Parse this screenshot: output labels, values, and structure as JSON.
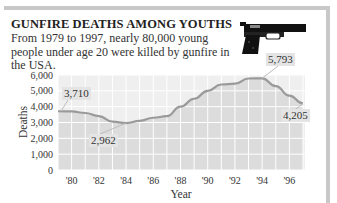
{
  "header": {
    "title": "GUNFIRE DEATHS AMONG YOUTHS",
    "subtitle": "From 1979 to 1997, nearly 80,000 young people under age 20 were killed by gunfire in the USA.",
    "icon": "handgun-icon"
  },
  "chart_data": {
    "type": "area",
    "title": "GUNFIRE DEATHS AMONG YOUTHS",
    "subtitle": "From 1979 to 1997, nearly 80,000 young people under age 20 were killed by gunfire in the USA.",
    "xlabel": "Year",
    "ylabel": "Deaths",
    "x": [
      1979,
      1980,
      1981,
      1982,
      1983,
      1984,
      1985,
      1986,
      1987,
      1988,
      1989,
      1990,
      1991,
      1992,
      1993,
      1994,
      1995,
      1996,
      1997
    ],
    "values": [
      3710,
      3700,
      3600,
      3400,
      3050,
      2962,
      3100,
      3300,
      3400,
      4000,
      4500,
      5000,
      5400,
      5450,
      5780,
      5793,
      5300,
      4700,
      4205
    ],
    "ylim": [
      0,
      6000
    ],
    "yticks": [
      0,
      1000,
      2000,
      3000,
      4000,
      5000,
      6000
    ],
    "ytick_labels": [
      "0",
      "1,000",
      "2,000",
      "3,000",
      "4,000",
      "5,000",
      "6,000"
    ],
    "xtick_labels": [
      "'80",
      "'82",
      "'84",
      "'86",
      "'88",
      "'90",
      "'92",
      "'94",
      "'96"
    ],
    "xtick_years": [
      1980,
      1982,
      1984,
      1986,
      1988,
      1990,
      1992,
      1994,
      1996
    ],
    "annotations": [
      {
        "year": 1979,
        "value": 3710,
        "label": "3,710"
      },
      {
        "year": 1984,
        "value": 2962,
        "label": "2,962"
      },
      {
        "year": 1994,
        "value": 5793,
        "label": "5,793"
      },
      {
        "year": 1997,
        "value": 4205,
        "label": "4,205"
      }
    ],
    "grid": true,
    "legend": "none"
  },
  "colors": {
    "frame": "#c8c8c8",
    "plot_bg": "#efefef",
    "area_fill": "#dcdcdc",
    "line": "#9a9a9a",
    "grid": "#ffffff",
    "callout_bg": "#e4e4e4"
  },
  "callouts": {
    "start": "3,710",
    "low": "2,962",
    "peak": "5,793",
    "end": "4,205"
  },
  "axes": {
    "xlabel": "Year",
    "ylabel": "Deaths"
  }
}
